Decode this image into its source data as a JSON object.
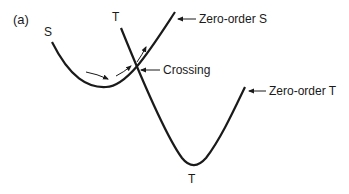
{
  "panel_label": "(a)",
  "curves": {
    "S": {
      "top_label": "S",
      "annotation": "Zero-order S"
    },
    "T": {
      "top_label": "T",
      "bottom_label": "T",
      "annotation": "Zero-order T"
    }
  },
  "crossing": {
    "annotation": "Crossing"
  },
  "colors": {
    "line": "#1a1a1a",
    "background": "#ffffff"
  }
}
